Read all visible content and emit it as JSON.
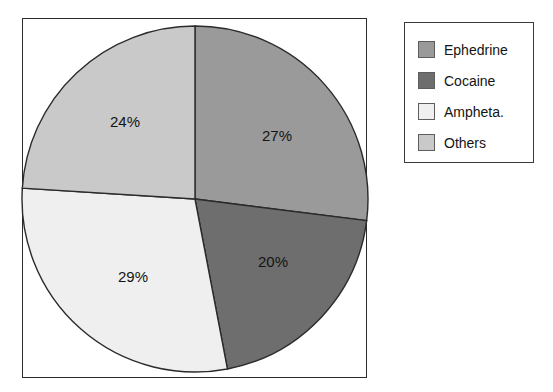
{
  "chart_data": {
    "type": "pie",
    "title": "",
    "categories": [
      "Ephedrine",
      "Cocaine",
      "Ampheta.",
      "Others"
    ],
    "values": [
      27,
      20,
      29,
      24
    ],
    "value_labels": [
      "27%",
      "20%",
      "29%",
      "24%"
    ],
    "unit": "%",
    "start_angle_deg": 0,
    "direction": "clockwise",
    "legend_position": "right",
    "grid": false,
    "colors": [
      "#9a9a9a",
      "#6e6e6e",
      "#efefef",
      "#c9c9c9"
    ],
    "slices": [
      {
        "label": "Ephedrine",
        "value": 27,
        "value_label": "27%",
        "color": "#9a9a9a",
        "label_x": 277,
        "label_y": 137
      },
      {
        "label": "Cocaine",
        "value": 20,
        "value_label": "20%",
        "color": "#6e6e6e",
        "label_x": 273,
        "label_y": 263
      },
      {
        "label": "Ampheta.",
        "value": 29,
        "value_label": "29%",
        "color": "#efefef",
        "label_x": 133,
        "label_y": 278
      },
      {
        "label": "Others",
        "value": 24,
        "value_label": "24%",
        "color": "#c9c9c9",
        "label_x": 125,
        "label_y": 123
      }
    ],
    "geometry": {
      "center_x": 195,
      "center_y": 199,
      "radius": 173,
      "outline_color": "#2b2b2b"
    }
  },
  "legend": {
    "items": [
      {
        "label": "Ephedrine",
        "color": "#9a9a9a"
      },
      {
        "label": "Cocaine",
        "color": "#6e6e6e"
      },
      {
        "label": "Ampheta.",
        "color": "#efefef"
      },
      {
        "label": "Others",
        "color": "#c9c9c9"
      }
    ]
  }
}
